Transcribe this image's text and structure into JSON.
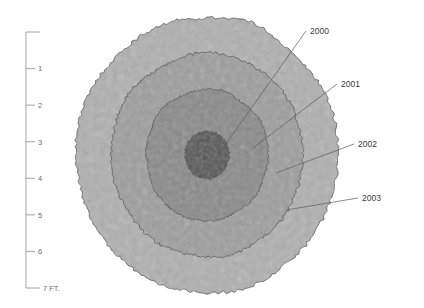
{
  "figure": {
    "type": "concentric-growth-rings-diagram",
    "background_color": "#ffffff",
    "outline_color": "#4a4a4a",
    "glow_color": "#b8b8b8"
  },
  "scale": {
    "name": "vertical-scale-bar",
    "unit_label": "7 FT.",
    "axis_color": "#9a9a9a",
    "ticks": [
      {
        "label": "",
        "value": 0
      },
      {
        "label": "1",
        "value": 1
      },
      {
        "label": "2",
        "value": 2
      },
      {
        "label": "3",
        "value": 3
      },
      {
        "label": "4",
        "value": 4
      },
      {
        "label": "5",
        "value": 5
      },
      {
        "label": "6",
        "value": 6
      },
      {
        "label": "7 FT.",
        "value": 7
      }
    ]
  },
  "rings": [
    {
      "year": "2000",
      "fill": "#555555",
      "order": 1
    },
    {
      "year": "2001",
      "fill": "#8a8a8a",
      "order": 2
    },
    {
      "year": "2002",
      "fill": "#9e9e9e",
      "order": 3
    },
    {
      "year": "2003",
      "fill": "#b0b0b0",
      "order": 4
    }
  ],
  "annotations": [
    {
      "label": "2000",
      "leader_color": "#5a5a5a"
    },
    {
      "label": "2001",
      "leader_color": "#5a5a5a"
    },
    {
      "label": "2002",
      "leader_color": "#5a5a5a"
    },
    {
      "label": "2003",
      "leader_color": "#5a5a5a"
    }
  ]
}
